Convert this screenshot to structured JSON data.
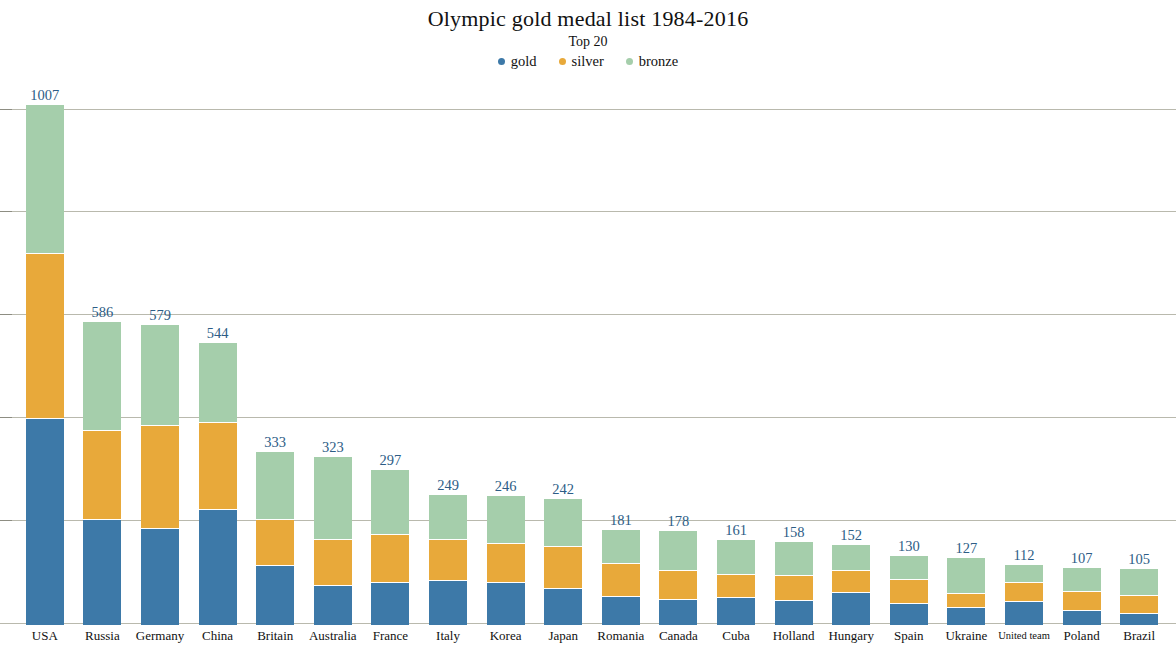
{
  "header": {
    "title": "Olympic gold medal list 1984-2016",
    "subtitle": "Top 20"
  },
  "legend": {
    "position": "top-center",
    "items": [
      {
        "label": "gold",
        "color": "#3d79a8"
      },
      {
        "label": "silver",
        "color": "#e8a93a"
      },
      {
        "label": "bronze",
        "color": "#a5ceab"
      }
    ]
  },
  "chart_data": {
    "type": "bar",
    "subtype": "stacked-vertical",
    "title": "Olympic gold medal list 1984-2016",
    "subtitle": "Top 20",
    "xlabel": "",
    "ylabel": "",
    "ylim": [
      0,
      1040
    ],
    "grid": true,
    "gridlines": [
      200,
      400,
      600,
      800,
      1000
    ],
    "axis_ticks_visible": false,
    "data_labels": "total",
    "categories": [
      "USA",
      "Russia",
      "Germany",
      "China",
      "Britain",
      "Australia",
      "France",
      "Italy",
      "Korea",
      "Japan",
      "Romania",
      "Canada",
      "Cuba",
      "Holland",
      "Hungary",
      "Spain",
      "Ukraine",
      "United team",
      "Poland",
      "Brazil"
    ],
    "series": [
      {
        "name": "gold",
        "color": "#3d79a8",
        "values": [
          400,
          204,
          186,
          224,
          114,
          76,
          81,
          86,
          81,
          70,
          55,
          48,
          52,
          47,
          62,
          41,
          33,
          45,
          27,
          22
        ]
      },
      {
        "name": "silver",
        "color": "#e8a93a",
        "values": [
          320,
          172,
          198,
          167,
          89,
          87,
          92,
          78,
          74,
          79,
          62,
          56,
          44,
          47,
          42,
          44,
          26,
          35,
          35,
          32
        ]
      },
      {
        "name": "bronze",
        "color": "#a5ceab",
        "values": [
          287,
          210,
          195,
          153,
          130,
          160,
          124,
          85,
          91,
          93,
          64,
          74,
          65,
          64,
          48,
          45,
          68,
          32,
          45,
          51
        ]
      }
    ],
    "totals": [
      1007,
      586,
      579,
      544,
      333,
      323,
      297,
      249,
      246,
      242,
      181,
      178,
      161,
      158,
      152,
      130,
      127,
      112,
      107,
      105
    ],
    "total_label_color": "#2d5d86"
  }
}
